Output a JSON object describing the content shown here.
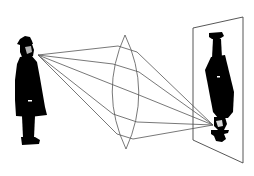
{
  "diagram": {
    "elements": {
      "object": "Standing man in bowler hat and long coat (upright)",
      "lens": "Biconvex (converging) lens",
      "screen": "Vertical projection screen shown in perspective",
      "image": "Inverted image of the man on the screen"
    },
    "ray_count": 5,
    "colors": {
      "rays": "#555555",
      "silhouette": "#000000",
      "background": "#ffffff"
    }
  }
}
